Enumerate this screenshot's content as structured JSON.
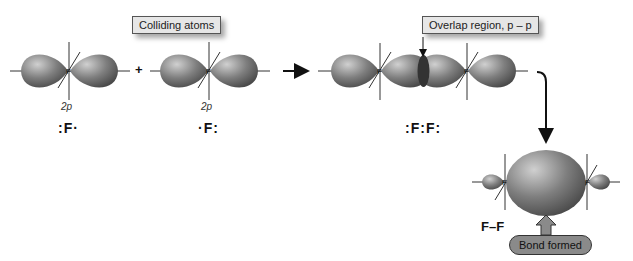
{
  "labels": {
    "colliding": "Colliding atoms",
    "overlap": "Overlap region, p – p",
    "bond_formed": "Bond formed"
  },
  "atoms": [
    {
      "symbol": "F",
      "orbital": "2p",
      "lewis": ":F·"
    },
    {
      "symbol": "F",
      "orbital": "2p",
      "lewis": "·F:"
    }
  ],
  "operators": {
    "plus": "+"
  },
  "molecule": {
    "lewis": ":F:F:",
    "formula": "F–F"
  },
  "colors": {
    "lobe": "#7a7a7a",
    "lobe_highlight": "#c8c8c8",
    "overlap": "#3a3a3a",
    "pill": "#8a8a8a",
    "box": "#e6e6e6"
  }
}
